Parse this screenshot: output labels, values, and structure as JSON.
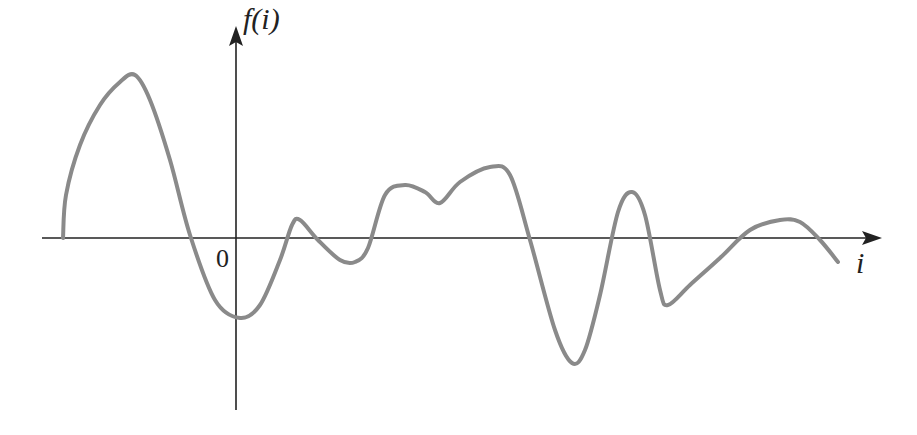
{
  "chart_data": {
    "type": "line",
    "title": "",
    "xlabel": "i",
    "ylabel": "f(i)",
    "origin_label": "0",
    "grid": false,
    "legend": null,
    "axis_style": "arrowed axes through origin, no numeric ticks",
    "curve_color": "#8a8a8a",
    "axis_color": "#222222",
    "series": [
      {
        "name": "f(i)",
        "points_px": [
          [
            63,
            238
          ],
          [
            66,
            195
          ],
          [
            80,
            145
          ],
          [
            100,
            105
          ],
          [
            120,
            82
          ],
          [
            135,
            75
          ],
          [
            150,
            100
          ],
          [
            170,
            160
          ],
          [
            190,
            235
          ],
          [
            215,
            300
          ],
          [
            240,
            318
          ],
          [
            260,
            305
          ],
          [
            280,
            260
          ],
          [
            292,
            225
          ],
          [
            300,
            220
          ],
          [
            318,
            240
          ],
          [
            340,
            260
          ],
          [
            355,
            262
          ],
          [
            368,
            248
          ],
          [
            385,
            195
          ],
          [
            405,
            185
          ],
          [
            425,
            192
          ],
          [
            440,
            203
          ],
          [
            460,
            182
          ],
          [
            490,
            167
          ],
          [
            510,
            175
          ],
          [
            530,
            240
          ],
          [
            555,
            330
          ],
          [
            572,
            363
          ],
          [
            585,
            350
          ],
          [
            600,
            295
          ],
          [
            618,
            212
          ],
          [
            632,
            192
          ],
          [
            645,
            215
          ],
          [
            660,
            290
          ],
          [
            668,
            305
          ],
          [
            690,
            285
          ],
          [
            720,
            258
          ],
          [
            750,
            230
          ],
          [
            780,
            220
          ],
          [
            800,
            222
          ],
          [
            820,
            240
          ],
          [
            838,
            262
          ]
        ]
      }
    ]
  }
}
